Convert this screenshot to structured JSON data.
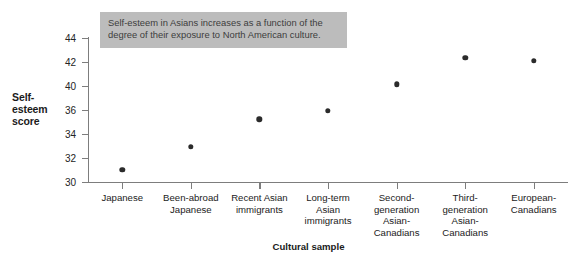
{
  "chart_data": {
    "type": "scatter",
    "title": "",
    "xlabel": "Cultural sample",
    "ylabel": "Self-esteem score",
    "ylabel_lines": [
      "Self-",
      "esteem",
      "score"
    ],
    "categories": [
      "Japanese",
      "Been-abroad Japanese",
      "Recent Asian immigrants",
      "Long-term Asian immigrants",
      "Second-generation Asian-Canadians",
      "Third-generation Asian-Canadians",
      "European-Canadians"
    ],
    "category_lines": [
      [
        "Japanese"
      ],
      [
        "Been-abroad",
        "Japanese"
      ],
      [
        "Recent Asian",
        "immigrants"
      ],
      [
        "Long-term",
        "Asian",
        "immigrants"
      ],
      [
        "Second-",
        "generation",
        "Asian-",
        "Canadians"
      ],
      [
        "Third-",
        "generation",
        "Asian-",
        "Canadians"
      ],
      [
        "European-",
        "Canadians"
      ]
    ],
    "values": [
      31.2,
      33.4,
      36.1,
      36.9,
      39.5,
      42.1,
      41.8
    ],
    "ytick_labels": [
      "44",
      "42",
      "40",
      "36",
      "34",
      "32",
      "30"
    ],
    "ylim": [
      30,
      44
    ],
    "grid": false,
    "legend": false,
    "marker_color": "#2b2b2b",
    "axis_color": "#7d7d7d"
  },
  "annotation": {
    "lines": [
      "Self-esteem in Asians increases as a function of the",
      "degree of their exposure to North American culture."
    ],
    "background_color": "#bcbcbc",
    "text_color": "#3d3d3d"
  }
}
